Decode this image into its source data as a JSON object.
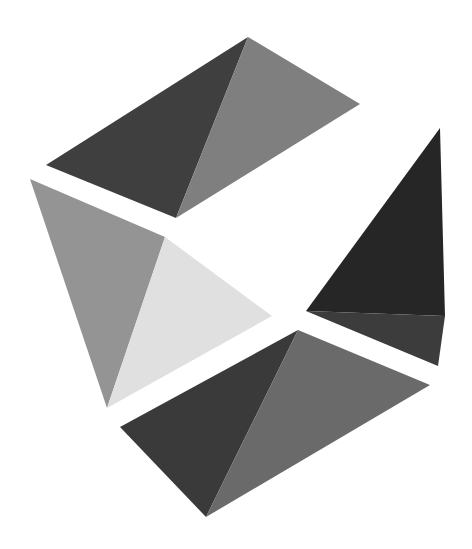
{
  "logo": {
    "name": "geometric-faceted-logo",
    "background": "#ffffff",
    "pieces": [
      {
        "name": "top-piece",
        "facets": [
          {
            "name": "top-piece-dark-facet",
            "color": "#3f3f3f",
            "points": "46,165 248,37 176,218"
          },
          {
            "name": "top-piece-light-facet",
            "color": "#7f7f7f",
            "points": "248,37 360,104 176,218"
          }
        ]
      },
      {
        "name": "left-piece",
        "facets": [
          {
            "name": "left-piece-mid-facet",
            "color": "#949494",
            "points": "30,179 165,237 107,408"
          },
          {
            "name": "left-piece-pale-facet",
            "color": "#e0e0e0",
            "points": "165,237 272,316 107,408"
          }
        ]
      },
      {
        "name": "right-piece",
        "facets": [
          {
            "name": "right-piece-dark-facet",
            "color": "#262626",
            "points": "440,128 445,316 306,311"
          },
          {
            "name": "right-piece-shade-facet",
            "color": "#3c3c3c",
            "points": "306,311 445,316 438,366"
          }
        ]
      },
      {
        "name": "bottom-piece",
        "facets": [
          {
            "name": "bottom-piece-dark-facet",
            "color": "#3a3a3a",
            "points": "120,427 298,330 206,517"
          },
          {
            "name": "bottom-piece-light-facet",
            "color": "#6a6a6a",
            "points": "298,330 430,385 206,517"
          }
        ]
      }
    ]
  }
}
